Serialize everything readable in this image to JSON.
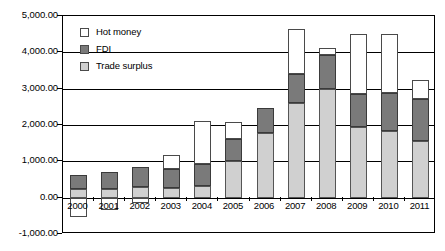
{
  "chart_data": {
    "type": "bar",
    "subtype": "stacked-column",
    "title": "",
    "xlabel": "",
    "ylabel": "",
    "categories": [
      "2000",
      "2001",
      "2002",
      "2003",
      "2004",
      "2005",
      "2006",
      "2007",
      "2008",
      "2009",
      "2010",
      "2011"
    ],
    "series": [
      {
        "name": "Trade surplus",
        "color": "#d0d0d0",
        "values": [
          241,
          225,
          304,
          255,
          320,
          1020,
          1775,
          2618,
          2981,
          1957,
          1831,
          1551
        ]
      },
      {
        "name": "FDI",
        "color": "#7a7a7a",
        "values": [
          384,
          468,
          527,
          535,
          606,
          603,
          694,
          783,
          952,
          900,
          1057,
          1160
        ]
      },
      {
        "name": "Hot money",
        "color": "#ffffff",
        "values": [
          -520,
          -330,
          -150,
          380,
          1180,
          470,
          0,
          1250,
          180,
          1640,
          1620,
          530
        ]
      }
    ],
    "ylim": [
      -1000,
      5000
    ],
    "ytick_values": [
      5000,
      4000,
      3000,
      2000,
      1000,
      0,
      -1000
    ],
    "ytick_labels": [
      "5,000.00",
      "4,000.00",
      "3,000.00",
      "2,000.00",
      "1,000.00",
      "0.00",
      "-1,000.00"
    ],
    "grid": "horizontal",
    "legend_position": "top-left",
    "legend": [
      {
        "label": "Hot money",
        "swatch": "sw-hot"
      },
      {
        "label": "FDI",
        "swatch": "sw-fdi"
      },
      {
        "label": "Trade surplus",
        "swatch": "sw-trade"
      }
    ]
  }
}
